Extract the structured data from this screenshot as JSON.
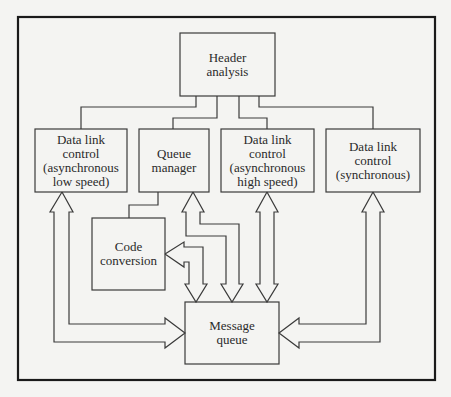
{
  "diagram": {
    "type": "block-diagram",
    "frame": {
      "x": 18,
      "y": 17,
      "w": 417,
      "h": 363
    },
    "colors": {
      "line": "#3a3a3a",
      "frame": "#1a1a1a",
      "background": "#f4f4f2",
      "text": "#2a2a2a"
    },
    "nodes": {
      "header": {
        "label": "Header\nanalysis",
        "x": 180,
        "y": 33,
        "w": 95,
        "h": 63
      },
      "dlc_low": {
        "label": "Data link\ncontrol\n(asynchronous\nlow speed)",
        "x": 35,
        "y": 129,
        "w": 92,
        "h": 63
      },
      "queue_manager": {
        "label": "Queue\nmanager",
        "x": 139,
        "y": 129,
        "w": 70,
        "h": 63
      },
      "dlc_high": {
        "label": "Data link\ncontrol\n(asynchronous\nhigh speed)",
        "x": 221,
        "y": 129,
        "w": 93,
        "h": 63
      },
      "dlc_sync": {
        "label": "Data link\ncontrol\n(synchronous)",
        "x": 326,
        "y": 129,
        "w": 94,
        "h": 63
      },
      "code_conversion": {
        "label": "Code\nconversion",
        "x": 92,
        "y": 218,
        "w": 73,
        "h": 72
      },
      "message_queue": {
        "label": "Message\nqueue",
        "x": 185,
        "y": 302,
        "w": 94,
        "h": 62
      }
    },
    "edges": [
      {
        "from": "header",
        "to": "dlc_low",
        "kind": "line"
      },
      {
        "from": "header",
        "to": "queue_manager",
        "kind": "line"
      },
      {
        "from": "header",
        "to": "dlc_high",
        "kind": "line"
      },
      {
        "from": "header",
        "to": "dlc_sync",
        "kind": "line"
      },
      {
        "from": "queue_manager",
        "to": "code_conversion",
        "kind": "line"
      },
      {
        "from": "dlc_low",
        "to": "message_queue",
        "kind": "double-arrow"
      },
      {
        "from": "queue_manager",
        "to": "message_queue",
        "kind": "double-arrow"
      },
      {
        "from": "code_conversion",
        "to": "message_queue",
        "kind": "double-arrow"
      },
      {
        "from": "dlc_high",
        "to": "message_queue",
        "kind": "double-arrow"
      },
      {
        "from": "dlc_sync",
        "to": "message_queue",
        "kind": "double-arrow"
      }
    ]
  }
}
